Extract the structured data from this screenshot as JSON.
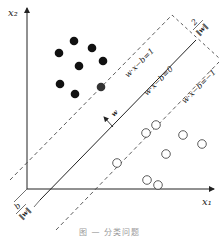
{
  "figure": {
    "type": "svm-maximum-margin-diagram",
    "axes": {
      "x_label": "x₁",
      "y_label": "x₂"
    },
    "lines": {
      "decision_boundary": "w·x−b=0",
      "positive_margin": "w·x−b=1",
      "negative_margin": "w·x−b=−1"
    },
    "annotations": {
      "normal_vector": "w",
      "margin_width_numerator": "2",
      "margin_width_denominator": "‖w‖",
      "offset_numerator": "b",
      "offset_denominator": "‖w‖"
    },
    "classes": {
      "filled": {
        "label": "class-positive",
        "color": "#111111",
        "points": [
          [
            74,
            41
          ],
          [
            92,
            48
          ],
          [
            59,
            53
          ],
          [
            79,
            66
          ],
          [
            103,
            61
          ],
          [
            60,
            84
          ],
          [
            75,
            94
          ],
          [
            101,
            87
          ]
        ]
      },
      "hollow": {
        "label": "class-negative",
        "color": "#ffffff",
        "points": [
          [
            156,
            125
          ],
          [
            117,
            163
          ],
          [
            146,
            133
          ],
          [
            183,
            135
          ],
          [
            166,
            154
          ],
          [
            202,
            144
          ],
          [
            147,
            180
          ],
          [
            158,
            185
          ]
        ]
      }
    },
    "caption": "图 — 分类问题"
  }
}
